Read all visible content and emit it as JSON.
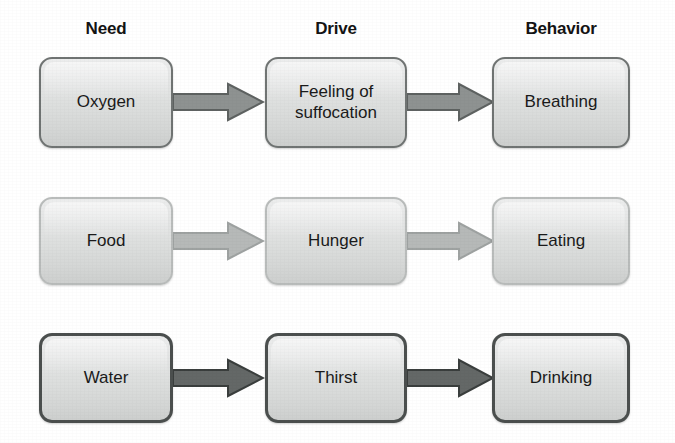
{
  "diagram": {
    "headers": [
      {
        "label": "Need"
      },
      {
        "label": "Drive"
      },
      {
        "label": "Behavior"
      }
    ],
    "rows": [
      {
        "name": "oxygen-row",
        "need": "Oxygen",
        "drive": "Feeling of\nsuffocation",
        "behavior": "Breathing",
        "border_color": "#707473",
        "arrow_fill": "#8e9291",
        "arrow_stroke": "#5e6261"
      },
      {
        "name": "food-row",
        "need": "Food",
        "drive": "Hunger",
        "behavior": "Eating",
        "border_color": "#b9bcbb",
        "arrow_fill": "#b6b9b8",
        "arrow_stroke": "#9ea2a1"
      },
      {
        "name": "water-row",
        "need": "Water",
        "drive": "Thirst",
        "behavior": "Drinking",
        "border_color": "#4b4f4e",
        "arrow_fill": "#646867",
        "arrow_stroke": "#3a3e3d"
      }
    ],
    "box_fill_light": "#eceded",
    "box_fill_dark": "#cdcfce",
    "text_color": "#1a1a1a",
    "background": "#ffffff"
  }
}
